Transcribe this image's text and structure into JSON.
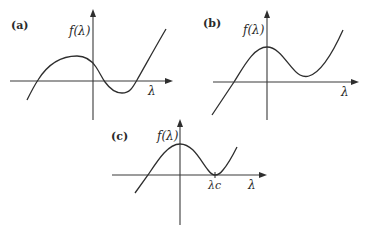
{
  "figure": {
    "panels": [
      {
        "id": "a",
        "label": "(a)",
        "y_axis_label": "f(λ)",
        "x_axis_label": "λ",
        "description": "Cubic-like curve with three real roots: rises to a local maximum left of the f-axis, dips to a local minimum below the λ-axis, then rises steeply."
      },
      {
        "id": "b",
        "label": "(b)",
        "y_axis_label": "f(λ)",
        "x_axis_label": "λ",
        "description": "Curve with one real root on the negative λ side, local maximum on the f-axis, local minimum above the λ-axis, then rising."
      },
      {
        "id": "c",
        "label": "(c)",
        "y_axis_label": "f(λ)",
        "x_axis_label": "λ",
        "critical_label": "λc",
        "description": "Critical case: local maximum on the f-axis, local minimum tangent to the λ-axis at λc (double root)."
      }
    ]
  }
}
